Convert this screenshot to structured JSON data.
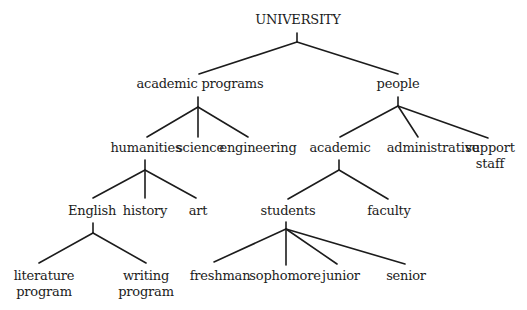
{
  "diagram": {
    "type": "tree",
    "title": "UNIVERSITY",
    "nodes": [
      {
        "id": "university",
        "label": "UNIVERSITY",
        "lines": [
          "UNIVERSITY"
        ],
        "x": 298,
        "y": 12
      },
      {
        "id": "academic-programs",
        "label": "academic programs",
        "lines": [
          "academic programs"
        ],
        "x": 200,
        "y": 76
      },
      {
        "id": "people",
        "label": "people",
        "lines": [
          "people"
        ],
        "x": 398,
        "y": 76
      },
      {
        "id": "humanities",
        "label": "humanities",
        "lines": [
          "humanities"
        ],
        "x": 146,
        "y": 140
      },
      {
        "id": "science",
        "label": "science",
        "lines": [
          "science"
        ],
        "x": 200,
        "y": 140
      },
      {
        "id": "engineering",
        "label": "engineering",
        "lines": [
          "engineering"
        ],
        "x": 258,
        "y": 140
      },
      {
        "id": "academic",
        "label": "academic",
        "lines": [
          "academic"
        ],
        "x": 340,
        "y": 140
      },
      {
        "id": "administrative",
        "label": "administrative",
        "lines": [
          "administrative"
        ],
        "x": 433,
        "y": 140
      },
      {
        "id": "support-staff",
        "label": "support staff",
        "lines": [
          "support",
          "staff"
        ],
        "x": 490,
        "y": 140
      },
      {
        "id": "english",
        "label": "English",
        "lines": [
          "English"
        ],
        "x": 92,
        "y": 203
      },
      {
        "id": "history",
        "label": "history",
        "lines": [
          "history"
        ],
        "x": 145,
        "y": 203
      },
      {
        "id": "art",
        "label": "art",
        "lines": [
          "art"
        ],
        "x": 198,
        "y": 203
      },
      {
        "id": "students",
        "label": "students",
        "lines": [
          "students"
        ],
        "x": 288,
        "y": 203
      },
      {
        "id": "faculty",
        "label": "faculty",
        "lines": [
          "faculty"
        ],
        "x": 389,
        "y": 203
      },
      {
        "id": "literature-program",
        "label": "literature program",
        "lines": [
          "literature",
          "program"
        ],
        "x": 44,
        "y": 268
      },
      {
        "id": "writing-program",
        "label": "writing program",
        "lines": [
          "writing",
          "program"
        ],
        "x": 146,
        "y": 268
      },
      {
        "id": "freshman",
        "label": "freshman",
        "lines": [
          "freshman"
        ],
        "x": 220,
        "y": 268
      },
      {
        "id": "sophomore",
        "label": "sophomore",
        "lines": [
          "sophomore"
        ],
        "x": 285,
        "y": 268
      },
      {
        "id": "junior",
        "label": "junior",
        "lines": [
          "junior"
        ],
        "x": 341,
        "y": 268
      },
      {
        "id": "senior",
        "label": "senior",
        "lines": [
          "senior"
        ],
        "x": 406,
        "y": 268
      }
    ],
    "junctions": [
      {
        "parent": "university",
        "stem": [
          297,
          33,
          297,
          42
        ],
        "children": [
          {
            "to": "academic-programs",
            "end": [
              199,
              74
            ]
          },
          {
            "to": "people",
            "end": [
              398,
              74
            ]
          }
        ]
      },
      {
        "parent": "academic-programs",
        "stem": [
          198,
          97,
          198,
          107
        ],
        "children": [
          {
            "to": "humanities",
            "end": [
              147,
              137
            ]
          },
          {
            "to": "science",
            "end": [
              198,
              137
            ]
          },
          {
            "to": "engineering",
            "end": [
              248,
              137
            ]
          }
        ]
      },
      {
        "parent": "people",
        "stem": [
          398,
          97,
          398,
          106
        ],
        "children": [
          {
            "to": "academic",
            "end": [
              340,
              137
            ]
          },
          {
            "to": "administrative",
            "end": [
              418,
              137
            ]
          },
          {
            "to": "support-staff",
            "end": [
              488,
              138
            ]
          }
        ]
      },
      {
        "parent": "humanities",
        "stem": [
          145,
          160,
          145,
          170
        ],
        "children": [
          {
            "to": "english",
            "end": [
              93,
              198
            ]
          },
          {
            "to": "history",
            "end": [
              145,
              198
            ]
          },
          {
            "to": "art",
            "end": [
              196,
              198
            ]
          }
        ]
      },
      {
        "parent": "academic",
        "stem": [
          339,
          160,
          339,
          170
        ],
        "children": [
          {
            "to": "students",
            "end": [
              288,
              199
            ]
          },
          {
            "to": "faculty",
            "end": [
              388,
              199
            ]
          }
        ]
      },
      {
        "parent": "english",
        "stem": [
          93,
          223,
          93,
          233
        ],
        "children": [
          {
            "to": "literature-program",
            "end": [
              39,
              263
            ]
          },
          {
            "to": "writing-program",
            "end": [
              146,
              263
            ]
          }
        ]
      },
      {
        "parent": "students",
        "stem": [
          286,
          222,
          286,
          229
        ],
        "children": [
          {
            "to": "freshman",
            "end": [
              214,
              262
            ]
          },
          {
            "to": "sophomore",
            "end": [
              286,
              265
            ]
          },
          {
            "to": "junior",
            "end": [
              337,
              264
            ]
          },
          {
            "to": "senior",
            "end": [
              405,
              264
            ]
          }
        ]
      }
    ],
    "colors": {
      "line": "#1c1c1c",
      "text": "#1c1c1c",
      "background": "#ffffff"
    }
  }
}
